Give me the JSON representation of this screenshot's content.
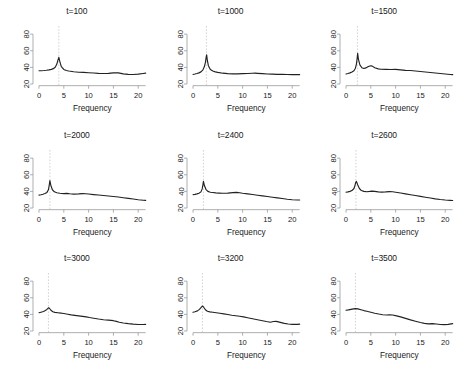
{
  "figure": {
    "layout": "3x3 grid of spectral density panels",
    "rows": 3,
    "cols": 3,
    "background": "#ffffff",
    "line_color": "#222222",
    "axis_color": "#9a9a9a",
    "reference_line_color": "#c8c8c8"
  },
  "axis": {
    "xlabel": "Frequency",
    "ylabel": "",
    "xticks": [
      "0",
      "5",
      "10",
      "15",
      "20"
    ],
    "xtick_values": [
      0,
      5,
      10,
      15,
      20
    ],
    "yticks": [
      "20",
      "40",
      "60",
      "80"
    ],
    "ytick_values": [
      20,
      40,
      60,
      80
    ],
    "xlim": [
      0,
      21.5
    ],
    "ylim": [
      18,
      85
    ],
    "grid": false,
    "ytick_orientation": "rotated-90"
  },
  "chart_data": [
    {
      "type": "line",
      "title": "t=100",
      "xlabel": "Frequency",
      "ylabel": "",
      "xlim": [
        0,
        21.5
      ],
      "ylim": [
        18,
        85
      ],
      "grid": false,
      "reference_line_x": 4.0,
      "peak_frequency": 4.0,
      "peak_value": 52,
      "x": [
        0,
        0.5,
        1,
        1.5,
        2,
        2.5,
        3,
        3.3,
        3.6,
        3.8,
        4.0,
        4.2,
        4.5,
        5,
        5.5,
        6,
        7,
        8,
        9,
        10,
        11,
        12,
        13,
        14,
        15,
        15.5,
        16,
        16.5,
        17,
        18,
        19,
        20,
        21,
        21.5
      ],
      "values": [
        36,
        36,
        36.2,
        36.5,
        37,
        37.6,
        38.8,
        40.5,
        44,
        48.5,
        52,
        47,
        41,
        37.5,
        36.2,
        35.6,
        34.8,
        34.2,
        34,
        33.6,
        33.2,
        32.8,
        32.6,
        32.8,
        33.4,
        33.6,
        33.4,
        32.8,
        32.2,
        31.6,
        31.4,
        31.8,
        32.6,
        33
      ]
    },
    {
      "type": "line",
      "title": "t=1000",
      "xlabel": "Frequency",
      "ylabel": "",
      "xlim": [
        0,
        21.5
      ],
      "ylim": [
        18,
        85
      ],
      "grid": false,
      "reference_line_x": 2.7,
      "peak_frequency": 2.7,
      "peak_value": 55,
      "x": [
        0,
        0.4,
        0.8,
        1.2,
        1.6,
        2.0,
        2.3,
        2.5,
        2.65,
        2.75,
        2.9,
        3.1,
        3.5,
        4,
        4.5,
        5,
        6,
        7,
        8,
        9,
        10,
        11,
        12,
        12.5,
        13,
        14,
        15,
        16,
        17,
        18,
        19,
        20,
        21,
        21.5
      ],
      "values": [
        31.5,
        32,
        32.6,
        33.4,
        34.6,
        37,
        41,
        46,
        52,
        55,
        48,
        42,
        37.5,
        35.6,
        34.6,
        34,
        33,
        32.4,
        32.2,
        32.2,
        32.4,
        32.6,
        32.9,
        33,
        32.8,
        32.4,
        32,
        31.8,
        31.6,
        31.5,
        31.4,
        31.3,
        31.3,
        31.3
      ]
    },
    {
      "type": "line",
      "title": "t=1500",
      "xlabel": "Frequency",
      "ylabel": "",
      "xlim": [
        0,
        21.5
      ],
      "ylim": [
        18,
        85
      ],
      "grid": false,
      "reference_line_x": 2.3,
      "peak_frequency": 2.3,
      "peak_value": 57,
      "x": [
        0,
        0.4,
        0.8,
        1.2,
        1.6,
        1.9,
        2.1,
        2.25,
        2.35,
        2.5,
        2.8,
        3.2,
        3.6,
        4,
        4.5,
        5,
        5.3,
        5.8,
        6.5,
        7,
        8,
        9,
        10,
        11,
        12,
        13,
        14,
        15,
        16,
        17,
        18,
        19,
        20,
        21,
        21.5
      ],
      "values": [
        32,
        32.6,
        33.4,
        34.4,
        36,
        39,
        44,
        51,
        57,
        50,
        43,
        39.5,
        38.6,
        39.4,
        41,
        42,
        41.5,
        39.5,
        38.2,
        37.8,
        37.6,
        37.4,
        37.6,
        37,
        36.4,
        36.2,
        35.6,
        35,
        34.4,
        33.8,
        33.2,
        32.6,
        32,
        31.4,
        31.2
      ]
    },
    {
      "type": "line",
      "title": "t=2000",
      "xlabel": "Frequency",
      "ylabel": "",
      "xlim": [
        0,
        21.5
      ],
      "ylim": [
        18,
        85
      ],
      "grid": false,
      "reference_line_x": 2.2,
      "peak_frequency": 2.2,
      "peak_value": 53,
      "x": [
        0,
        0.4,
        0.8,
        1.2,
        1.6,
        1.9,
        2.05,
        2.2,
        2.4,
        2.7,
        3.1,
        3.6,
        4.2,
        5,
        5.6,
        6.2,
        7,
        8,
        8.8,
        9.4,
        10,
        11,
        12,
        13,
        14,
        15,
        16,
        17,
        18,
        19,
        20,
        21,
        21.5
      ],
      "values": [
        35.5,
        36,
        36.6,
        37.4,
        38.8,
        42,
        47,
        53,
        47,
        42,
        39.5,
        38.4,
        37.8,
        37.4,
        37.6,
        37.2,
        36.8,
        37,
        37.4,
        37.2,
        36.8,
        36.2,
        35.6,
        35,
        34.4,
        33.8,
        33.2,
        32.4,
        31.6,
        30.8,
        30,
        29.4,
        29.2
      ]
    },
    {
      "type": "line",
      "title": "t=2400",
      "xlabel": "Frequency",
      "ylabel": "",
      "xlim": [
        0,
        21.5
      ],
      "ylim": [
        18,
        85
      ],
      "grid": false,
      "reference_line_x": 2.1,
      "peak_frequency": 2.1,
      "peak_value": 52,
      "x": [
        0,
        0.4,
        0.8,
        1.2,
        1.6,
        1.85,
        2.0,
        2.1,
        2.3,
        2.6,
        3,
        3.5,
        4,
        4.6,
        5.2,
        6,
        7,
        8,
        8.8,
        9.4,
        10,
        11,
        12,
        13,
        14,
        15,
        16,
        17,
        18,
        19,
        20,
        21,
        21.5
      ],
      "values": [
        36,
        36.4,
        37,
        37.8,
        39.4,
        43,
        48,
        52,
        47,
        42.5,
        40,
        39,
        38.6,
        38.2,
        38,
        37.8,
        38,
        38.6,
        38.8,
        38.4,
        37.8,
        37,
        36.2,
        35.4,
        34.6,
        33.8,
        33,
        32.2,
        31.4,
        30.6,
        30,
        29.6,
        29.6
      ]
    },
    {
      "type": "line",
      "title": "t=2600",
      "xlabel": "Frequency",
      "ylabel": "",
      "xlim": [
        0,
        21.5
      ],
      "ylim": [
        18,
        85
      ],
      "grid": false,
      "reference_line_x": 2.0,
      "peak_frequency": 2.0,
      "peak_value": 52,
      "x": [
        0,
        0.4,
        0.8,
        1.2,
        1.6,
        1.8,
        1.95,
        2.1,
        2.35,
        2.7,
        3.1,
        3.6,
        4.2,
        4.8,
        5.2,
        5.8,
        6.5,
        7.2,
        8,
        8.8,
        9.4,
        10,
        11,
        12,
        13,
        14,
        15,
        16,
        17,
        18,
        19,
        20,
        21,
        21.5
      ],
      "values": [
        39,
        39.4,
        40,
        41,
        43.5,
        47,
        50.5,
        52,
        48,
        43.5,
        41,
        40,
        39.6,
        40,
        40.4,
        40,
        39.4,
        39.2,
        39.4,
        39.8,
        39.6,
        39,
        38,
        37,
        36,
        35,
        34,
        33,
        32,
        31,
        30.2,
        29.6,
        29.2,
        29
      ]
    },
    {
      "type": "line",
      "title": "t=3000",
      "xlabel": "Frequency",
      "ylabel": "",
      "xlim": [
        0,
        21.5
      ],
      "ylim": [
        18,
        85
      ],
      "grid": false,
      "reference_line_x": 1.9,
      "peak_frequency": 1.9,
      "peak_value": 48,
      "x": [
        0,
        0.4,
        0.9,
        1.3,
        1.6,
        1.8,
        1.95,
        2.1,
        2.4,
        2.8,
        3.2,
        3.8,
        4.4,
        5,
        5.8,
        6.5,
        7.2,
        8,
        8.8,
        9.5,
        10.2,
        11,
        12,
        13,
        14,
        15,
        15.6,
        16.2,
        17,
        18,
        19,
        20,
        21,
        21.5
      ],
      "values": [
        42,
        42.6,
        43.4,
        44.6,
        46,
        47.2,
        48,
        47.4,
        45,
        43.2,
        42.4,
        42,
        41.6,
        41,
        40.2,
        39.4,
        38.8,
        38.2,
        37.6,
        37,
        36.2,
        35.4,
        34.4,
        33.6,
        33,
        32.4,
        31.6,
        30.6,
        29.6,
        28.8,
        28.2,
        27.8,
        27.8,
        28
      ]
    },
    {
      "type": "line",
      "title": "t=3200",
      "xlabel": "Frequency",
      "ylabel": "",
      "xlim": [
        0,
        21.5
      ],
      "ylim": [
        18,
        85
      ],
      "grid": false,
      "reference_line_x": 1.9,
      "peak_frequency": 1.9,
      "peak_value": 50,
      "x": [
        0,
        0.4,
        0.9,
        1.3,
        1.6,
        1.8,
        1.95,
        2.15,
        2.5,
        2.9,
        3.4,
        4,
        4.7,
        5.4,
        6.2,
        7,
        7.8,
        8.6,
        9.4,
        10.2,
        11,
        12,
        13,
        14,
        14.8,
        15.6,
        16.2,
        16.8,
        17.6,
        18.4,
        19.2,
        20,
        21,
        21.5
      ],
      "values": [
        42.5,
        43.2,
        44.2,
        46,
        48,
        49.4,
        50,
        48.6,
        45.6,
        43.8,
        43,
        42.6,
        42,
        41.4,
        40.6,
        39.8,
        39,
        38.4,
        37.8,
        37,
        36,
        34.8,
        33.6,
        32.4,
        31.4,
        30.6,
        31.4,
        31.6,
        30.4,
        29.2,
        28.4,
        28,
        28,
        28.2
      ]
    },
    {
      "type": "line",
      "title": "t=3500",
      "xlabel": "Frequency",
      "ylabel": "",
      "xlim": [
        0,
        21.5
      ],
      "ylim": [
        18,
        85
      ],
      "grid": false,
      "reference_line_x": 1.9,
      "peak_frequency": 1.9,
      "peak_value": 47,
      "x": [
        0,
        0.5,
        1,
        1.5,
        1.9,
        2.4,
        3,
        3.6,
        4.2,
        5,
        5.8,
        6.6,
        7.4,
        8.2,
        8.8,
        9.4,
        10.2,
        11,
        12,
        13,
        14,
        15,
        15.8,
        16.6,
        17.4,
        18.2,
        19,
        19.8,
        20.6,
        21.2,
        21.5
      ],
      "values": [
        45,
        45.4,
        46,
        46.6,
        47,
        46.6,
        45.6,
        44.6,
        43.8,
        42.6,
        41.4,
        40.4,
        39.6,
        39.2,
        39.4,
        39.2,
        38.2,
        37,
        35.2,
        33.4,
        31.8,
        30.2,
        29.2,
        28.6,
        28.8,
        28.4,
        27.8,
        27.6,
        28,
        28.6,
        28.8
      ]
    }
  ]
}
